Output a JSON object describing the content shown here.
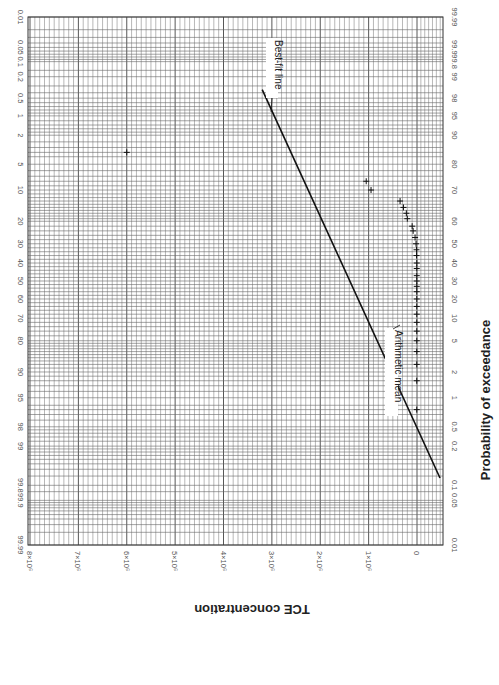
{
  "chart_data": {
    "type": "scatter",
    "orientation": "rotated-90-clockwise",
    "title": "",
    "xlabel": "Probability of exceedance",
    "ylabel": "TCE concentration",
    "probability_ticks": [
      "0.01",
      "0.05",
      "0.1",
      "0.2",
      "0.5",
      "1",
      "2",
      "5",
      "10",
      "20",
      "30",
      "40",
      "50",
      "60",
      "70",
      "80",
      "90",
      "95",
      "98",
      "99",
      "99.8",
      "99.9",
      "99.99"
    ],
    "probability_ticks_opposite": [
      "99.99",
      "99.9",
      "99.8",
      "99",
      "98",
      "95",
      "90",
      "80",
      "70",
      "60",
      "50",
      "40",
      "30",
      "20",
      "10",
      "5",
      "2",
      "1",
      "0.5",
      "0.2",
      "0.1",
      "0.05",
      "0.01"
    ],
    "concentration_ticks": [
      "0",
      "1×10⁶",
      "2×10⁶",
      "3×10⁶",
      "4×10⁶",
      "5×10⁶",
      "6×10⁶",
      "7×10⁶",
      "8×10⁶"
    ],
    "concentration_range": [
      0,
      8000000
    ],
    "probability_range": [
      0.01,
      99.99
    ],
    "grid": true,
    "series": [
      {
        "name": "Observed TCE concentrations",
        "marker": "+",
        "points": [
          {
            "p": 3.5,
            "c": 6000000
          },
          {
            "p": 8,
            "c": 1050000
          },
          {
            "p": 10,
            "c": 950000
          },
          {
            "p": 13,
            "c": 350000
          },
          {
            "p": 15,
            "c": 280000
          },
          {
            "p": 17,
            "c": 220000
          },
          {
            "p": 19,
            "c": 200000
          },
          {
            "p": 22,
            "c": 100000
          },
          {
            "p": 24,
            "c": 80000
          },
          {
            "p": 27,
            "c": 40000
          },
          {
            "p": 30,
            "c": 20000
          },
          {
            "p": 33,
            "c": 10000
          },
          {
            "p": 36,
            "c": 10000
          },
          {
            "p": 40,
            "c": 5000
          },
          {
            "p": 43,
            "c": 5000
          },
          {
            "p": 47,
            "c": 5000
          },
          {
            "p": 50,
            "c": 5000
          },
          {
            "p": 53,
            "c": 5000
          },
          {
            "p": 56,
            "c": 5000
          },
          {
            "p": 60,
            "c": 5000
          },
          {
            "p": 64,
            "c": 5000
          },
          {
            "p": 68,
            "c": 5000
          },
          {
            "p": 72,
            "c": 5000
          },
          {
            "p": 76,
            "c": 5000
          },
          {
            "p": 80,
            "c": 5000
          },
          {
            "p": 84,
            "c": 5000
          },
          {
            "p": 88,
            "c": 5000
          },
          {
            "p": 92,
            "c": 5000
          },
          {
            "p": 96.5,
            "c": 5000
          }
        ]
      },
      {
        "name": "Best-fit line",
        "type": "line",
        "points": [
          {
            "p": 0.35,
            "c": 3200000
          },
          {
            "p": 7,
            "c": -400000
          }
        ]
      }
    ],
    "annotations": [
      {
        "text": "Best-fit line",
        "p": 0.5,
        "c": 2950000
      },
      {
        "text": "Arithmetic mean",
        "p": 50,
        "c": 350000
      }
    ]
  }
}
